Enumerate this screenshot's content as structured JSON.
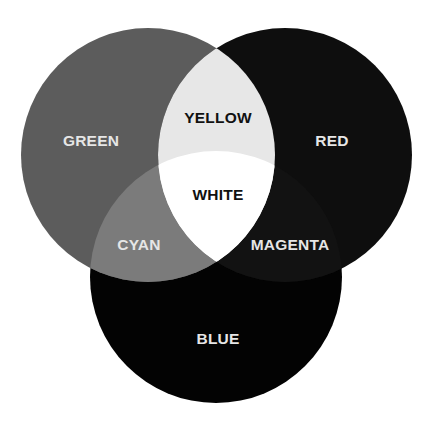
{
  "diagram": {
    "type": "venn-additive-color",
    "background": "#ffffff",
    "circles": [
      {
        "id": "green",
        "label": "GREEN",
        "cx": 148,
        "cy": 155,
        "r": 127,
        "fill": "#5c5c5c",
        "text_color": "#e6e6e6"
      },
      {
        "id": "red",
        "label": "RED",
        "cx": 285,
        "cy": 155,
        "r": 127,
        "fill": "#0e0e0e",
        "text_color": "#e6e6e6"
      },
      {
        "id": "blue",
        "label": "BLUE",
        "cx": 216,
        "cy": 277,
        "r": 126,
        "fill": "#030303",
        "text_color": "#e6e6e6"
      }
    ],
    "overlaps": [
      {
        "id": "yellow",
        "label": "YELLOW",
        "sets": [
          "green",
          "red"
        ],
        "fill": "#e7e7e7",
        "text_color": "#111111"
      },
      {
        "id": "cyan",
        "label": "CYAN",
        "sets": [
          "green",
          "blue"
        ],
        "fill": "#7b7b7b",
        "text_color": "#e6e6e6"
      },
      {
        "id": "magenta",
        "label": "MAGENTA",
        "sets": [
          "red",
          "blue"
        ],
        "fill": "#121212",
        "text_color": "#e6e6e6"
      },
      {
        "id": "white",
        "label": "WHITE",
        "sets": [
          "green",
          "red",
          "blue"
        ],
        "fill": "#ffffff",
        "text_color": "#111111"
      }
    ],
    "labels": {
      "green": {
        "text": "GREEN",
        "x": 91,
        "y": 146
      },
      "red": {
        "text": "RED",
        "x": 332,
        "y": 146
      },
      "yellow": {
        "text": "YELLOW",
        "x": 218,
        "y": 123
      },
      "white": {
        "text": "WHITE",
        "x": 218,
        "y": 200
      },
      "cyan": {
        "text": "CYAN",
        "x": 139,
        "y": 250
      },
      "magenta": {
        "text": "MAGENTA",
        "x": 290,
        "y": 250
      },
      "blue": {
        "text": "BLUE",
        "x": 218,
        "y": 344
      }
    }
  }
}
